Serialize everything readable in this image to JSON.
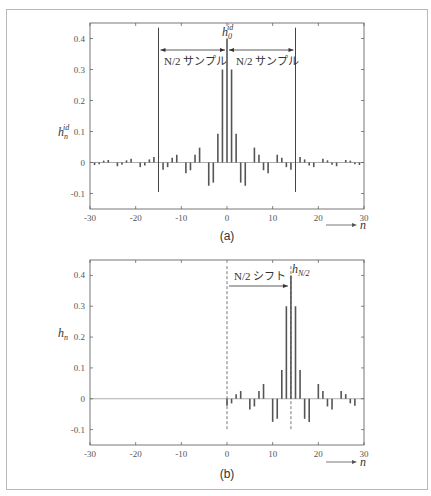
{
  "chart_data": [
    {
      "type": "stem",
      "panel_label": "(a)",
      "title": "",
      "xlabel": "n",
      "ylabel": "h_n^id",
      "xlim": [
        -30,
        30
      ],
      "ylim": [
        -0.15,
        0.45
      ],
      "xticks": [
        -30,
        -20,
        -10,
        0,
        10,
        20,
        30
      ],
      "xtick_labels": [
        "-30",
        "-20",
        "-10",
        "0",
        "10",
        "20",
        "30"
      ],
      "yticks": [
        -0.1,
        0,
        0.1,
        0.2,
        0.3,
        0.4
      ],
      "ytick_labels": [
        "-0.1",
        "0",
        "0.1",
        "0.2",
        "0.3",
        "0.4"
      ],
      "grid": false,
      "x": [
        -29,
        -28,
        -27,
        -26,
        -25,
        -24,
        -23,
        -22,
        -21,
        -20,
        -19,
        -18,
        -17,
        -16,
        -15,
        -14,
        -13,
        -12,
        -11,
        -10,
        -9,
        -8,
        -7,
        -6,
        -5,
        -4,
        -3,
        -2,
        -1,
        0,
        1,
        2,
        3,
        4,
        5,
        6,
        7,
        8,
        9,
        10,
        11,
        12,
        13,
        14,
        15,
        16,
        17,
        18,
        19,
        20,
        21,
        22,
        23,
        24,
        25,
        26,
        27,
        28,
        29
      ],
      "values": [
        -0.008,
        -0.006,
        0.006,
        0.008,
        0,
        -0.012,
        -0.007,
        0.007,
        0.012,
        0,
        -0.015,
        -0.01,
        0.01,
        0.018,
        0,
        -0.023,
        -0.015,
        0.015,
        0.025,
        0,
        -0.035,
        -0.025,
        0.025,
        0.048,
        0,
        -0.075,
        -0.065,
        0.093,
        0.3,
        0.4,
        0.3,
        0.093,
        -0.065,
        -0.075,
        0,
        0.048,
        0.025,
        -0.025,
        -0.035,
        0,
        0.025,
        0.015,
        -0.015,
        -0.023,
        0,
        0.018,
        0.01,
        -0.01,
        -0.015,
        0,
        0.012,
        0.007,
        -0.007,
        -0.012,
        0,
        0.008,
        0.006,
        -0.006,
        -0.008
      ],
      "vertical_lines": [
        -15,
        15
      ],
      "annotations": [
        {
          "text": "h_0^id",
          "at_n": 0,
          "at_y": 0.42
        },
        {
          "text": "N/2 サンプル",
          "span": [
            -15,
            0
          ],
          "arrow": "both"
        },
        {
          "text": "N/2 サンプル",
          "span": [
            0,
            15
          ],
          "arrow": "both"
        }
      ]
    },
    {
      "type": "stem",
      "panel_label": "(b)",
      "title": "",
      "xlabel": "n",
      "ylabel": "h_n",
      "xlim": [
        -30,
        30
      ],
      "ylim": [
        -0.15,
        0.45
      ],
      "xticks": [
        -30,
        -20,
        -10,
        0,
        10,
        20,
        30
      ],
      "xtick_labels": [
        "-30",
        "-20",
        "-10",
        "0",
        "10",
        "20",
        "30"
      ],
      "yticks": [
        -0.1,
        0,
        0.1,
        0.2,
        0.3,
        0.4
      ],
      "ytick_labels": [
        "-0.1",
        "0",
        "0.1",
        "0.2",
        "0.3",
        "0.4"
      ],
      "grid": false,
      "x": [
        0,
        1,
        2,
        3,
        4,
        5,
        6,
        7,
        8,
        9,
        10,
        11,
        12,
        13,
        14,
        15,
        16,
        17,
        18,
        19,
        20,
        21,
        22,
        23,
        24,
        25,
        26,
        27,
        28
      ],
      "values": [
        -0.023,
        -0.015,
        0.015,
        0.025,
        0,
        -0.035,
        -0.025,
        0.025,
        0.048,
        0,
        -0.075,
        -0.065,
        0.093,
        0.3,
        0.4,
        0.3,
        0.093,
        -0.065,
        -0.075,
        0,
        0.048,
        0.025,
        -0.025,
        -0.035,
        0,
        0.025,
        0.015,
        -0.015,
        -0.023
      ],
      "dashed_lines": [
        0,
        14
      ],
      "annotations": [
        {
          "text": "h_N/2",
          "at_n": 14,
          "at_y": 0.41
        },
        {
          "text": "N/2 シフト",
          "span": [
            0,
            14
          ],
          "arrow": "right"
        }
      ]
    }
  ],
  "labels": {
    "panel_a": "(a)",
    "panel_b": "(b)",
    "n_axis": "n",
    "ylabel_a_base": "h",
    "ylabel_a_sub": "n",
    "ylabel_a_sup": "id",
    "ylabel_b_base": "h",
    "ylabel_b_sub": "n",
    "peak_a_base": "h",
    "peak_a_sub": "0",
    "peak_a_sup": "id",
    "peak_b_base": "h",
    "peak_b_sub": "N/2",
    "samples_left": "N/2 サンプル",
    "samples_right": "N/2 サンプル",
    "shift": "N/2 シフト"
  }
}
